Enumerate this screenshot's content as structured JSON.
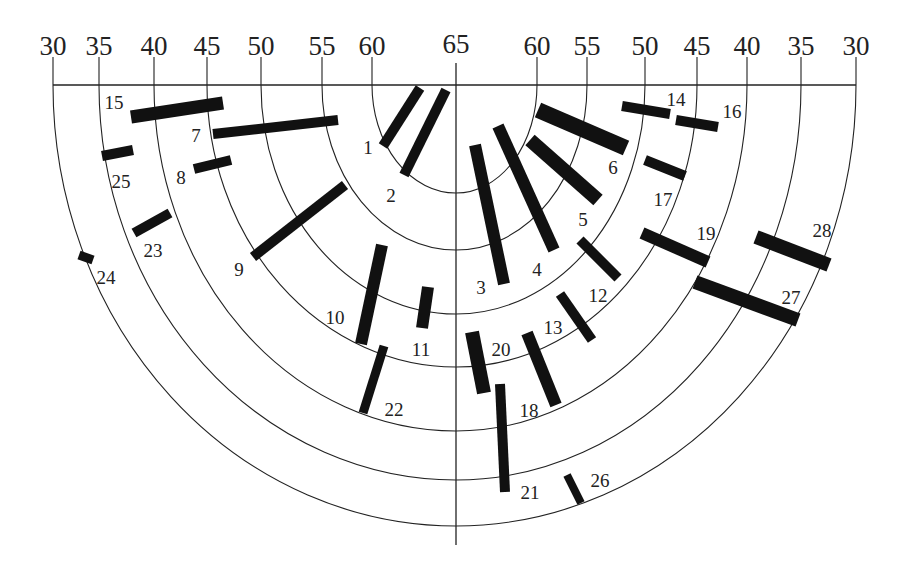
{
  "diagram": {
    "center": {
      "x": 456,
      "y": 85
    },
    "axis_bottom_y": 545,
    "scale_labels_left": [
      "30",
      "35",
      "40",
      "45",
      "50",
      "55",
      "60"
    ],
    "scale_labels_right": [
      "60",
      "55",
      "50",
      "45",
      "40",
      "35",
      "30"
    ],
    "center_label": "65",
    "rings": [
      {
        "value": 60,
        "rx": 82,
        "ry": 108,
        "left_tick_x": 372,
        "right_tick_x": 537
      },
      {
        "value": 55,
        "rx": 133,
        "ry": 165,
        "left_tick_x": 322,
        "right_tick_x": 587
      },
      {
        "value": 50,
        "rx": 192,
        "ry": 229,
        "left_tick_x": 261,
        "right_tick_x": 645
      },
      {
        "value": 45,
        "rx": 245,
        "ry": 282,
        "left_tick_x": 207,
        "right_tick_x": 697
      },
      {
        "value": 40,
        "rx": 297,
        "ry": 346,
        "left_tick_x": 154,
        "right_tick_x": 747
      },
      {
        "value": 35,
        "rx": 351,
        "ry": 395,
        "left_tick_x": 99,
        "right_tick_x": 801
      },
      {
        "value": 30,
        "rx": 402,
        "ry": 441,
        "left_tick_x": 53,
        "right_tick_x": 856
      }
    ],
    "bars": [
      {
        "id": "1",
        "x1": 420,
        "y1": 88,
        "x2": 383,
        "y2": 146,
        "w": 10,
        "lx": 368,
        "ly": 154
      },
      {
        "id": "2",
        "x1": 446,
        "y1": 90,
        "x2": 404,
        "y2": 175,
        "w": 10,
        "lx": 391,
        "ly": 202
      },
      {
        "id": "3",
        "x1": 475,
        "y1": 145,
        "x2": 504,
        "y2": 284,
        "w": 12,
        "lx": 481,
        "ly": 294
      },
      {
        "id": "4",
        "x1": 498,
        "y1": 126,
        "x2": 554,
        "y2": 250,
        "w": 12,
        "lx": 537,
        "ly": 276
      },
      {
        "id": "5",
        "x1": 530,
        "y1": 140,
        "x2": 598,
        "y2": 200,
        "w": 14,
        "lx": 583,
        "ly": 226
      },
      {
        "id": "6",
        "x1": 538,
        "y1": 110,
        "x2": 626,
        "y2": 148,
        "w": 16,
        "lx": 613,
        "ly": 174
      },
      {
        "id": "7",
        "x1": 213,
        "y1": 134,
        "x2": 338,
        "y2": 120,
        "w": 10,
        "lx": 196,
        "ly": 142
      },
      {
        "id": "8",
        "x1": 194,
        "y1": 169,
        "x2": 231,
        "y2": 160,
        "w": 10,
        "lx": 181,
        "ly": 184
      },
      {
        "id": "9",
        "x1": 253,
        "y1": 257,
        "x2": 345,
        "y2": 185,
        "w": 10,
        "lx": 239,
        "ly": 276
      },
      {
        "id": "10",
        "x1": 382,
        "y1": 245,
        "x2": 361,
        "y2": 344,
        "w": 12,
        "lx": 335,
        "ly": 324
      },
      {
        "id": "11",
        "x1": 428,
        "y1": 287,
        "x2": 422,
        "y2": 328,
        "w": 12,
        "lx": 421,
        "ly": 356
      },
      {
        "id": "12",
        "x1": 580,
        "y1": 240,
        "x2": 618,
        "y2": 278,
        "w": 10,
        "lx": 598,
        "ly": 302
      },
      {
        "id": "13",
        "x1": 560,
        "y1": 294,
        "x2": 592,
        "y2": 340,
        "w": 10,
        "lx": 553,
        "ly": 334
      },
      {
        "id": "14",
        "x1": 622,
        "y1": 106,
        "x2": 670,
        "y2": 114,
        "w": 10,
        "lx": 676,
        "ly": 106
      },
      {
        "id": "15",
        "x1": 131,
        "y1": 117,
        "x2": 223,
        "y2": 103,
        "w": 13,
        "lx": 114,
        "ly": 109
      },
      {
        "id": "16",
        "x1": 676,
        "y1": 120,
        "x2": 718,
        "y2": 127,
        "w": 10,
        "lx": 732,
        "ly": 118
      },
      {
        "id": "17",
        "x1": 645,
        "y1": 160,
        "x2": 685,
        "y2": 176,
        "w": 10,
        "lx": 663,
        "ly": 206
      },
      {
        "id": "18",
        "x1": 527,
        "y1": 333,
        "x2": 556,
        "y2": 405,
        "w": 12,
        "lx": 529,
        "ly": 417
      },
      {
        "id": "19",
        "x1": 642,
        "y1": 233,
        "x2": 708,
        "y2": 262,
        "w": 12,
        "lx": 706,
        "ly": 240
      },
      {
        "id": "20",
        "x1": 472,
        "y1": 332,
        "x2": 484,
        "y2": 393,
        "w": 14,
        "lx": 501,
        "ly": 356
      },
      {
        "id": "21",
        "x1": 500,
        "y1": 384,
        "x2": 505,
        "y2": 492,
        "w": 10,
        "lx": 530,
        "ly": 499
      },
      {
        "id": "22",
        "x1": 384,
        "y1": 346,
        "x2": 363,
        "y2": 413,
        "w": 9,
        "lx": 394,
        "ly": 416
      },
      {
        "id": "23",
        "x1": 134,
        "y1": 233,
        "x2": 170,
        "y2": 213,
        "w": 10,
        "lx": 153,
        "ly": 257
      },
      {
        "id": "24",
        "x1": 79,
        "y1": 255,
        "x2": 93,
        "y2": 260,
        "w": 9,
        "lx": 106,
        "ly": 284
      },
      {
        "id": "25",
        "x1": 102,
        "y1": 156,
        "x2": 133,
        "y2": 150,
        "w": 10,
        "lx": 121,
        "ly": 188
      },
      {
        "id": "26",
        "x1": 567,
        "y1": 475,
        "x2": 581,
        "y2": 503,
        "w": 8,
        "lx": 600,
        "ly": 487
      },
      {
        "id": "27",
        "x1": 695,
        "y1": 282,
        "x2": 798,
        "y2": 320,
        "w": 14,
        "lx": 791,
        "ly": 304
      },
      {
        "id": "28",
        "x1": 756,
        "y1": 237,
        "x2": 829,
        "y2": 265,
        "w": 14,
        "lx": 822,
        "ly": 237
      }
    ]
  }
}
